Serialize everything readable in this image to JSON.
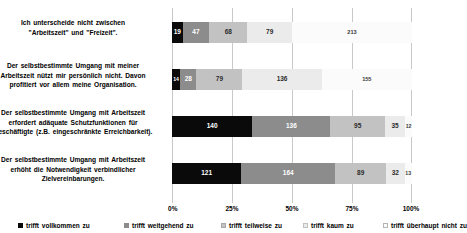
{
  "chart_data": {
    "type": "bar",
    "orientation": "horizontal",
    "stacked": true,
    "normalized": true,
    "title": "",
    "xlabel": "",
    "ylabel": "",
    "xlim": [
      0,
      100
    ],
    "xticks": [
      "0%",
      "25%",
      "50%",
      "75%",
      "100%"
    ],
    "xtick_values": [
      0,
      25,
      50,
      75,
      100
    ],
    "grid": true,
    "legend_position": "bottom",
    "categories": [
      "Ich unterscheide nicht zwischen \"Arbeitszeit\" und \"Freizeit\".",
      "Der selbstbestimmte Umgang mit meiner Arbeitszeit nützt mir persönlich nicht. Davon profitiert vor allem meine Organisation.",
      "Der selbstbestimmte Umgang mit Arbeitszeit erfordert adäquate Schutzfunktionen für Beschäftigte (z.B. eingeschränkte Erreichbarkeit).",
      "Der selbstbestimmte Umgang mit Arbeitszeit erhöht die Notwendigkeit verbindlicher Zielvereinbarungen."
    ],
    "series": [
      {
        "name": "trifft vollkommen zu",
        "color": "#0a0a0a",
        "values": [
          19,
          14,
          140,
          121
        ]
      },
      {
        "name": "trifft weitgehend zu",
        "color": "#8c8c8c",
        "values": [
          47,
          28,
          136,
          164
        ]
      },
      {
        "name": "trifft teilweise zu",
        "color": "#c2c2c2",
        "values": [
          68,
          79,
          95,
          89
        ]
      },
      {
        "name": "trifft kaum zu",
        "color": "#ebebeb",
        "values": [
          79,
          136,
          35,
          32
        ]
      },
      {
        "name": "trifft überhaupt nicht zu",
        "color": "#fcfcfc",
        "values": [
          213,
          155,
          12,
          13
        ]
      }
    ],
    "totals": [
      426,
      412,
      418,
      419
    ]
  },
  "rows": [
    {
      "label_lines": [
        "Ich unterscheide  nicht  zwischen",
        "\"Arbeitszeit\"  und  \"Freizeit\"."
      ],
      "values": [
        19,
        47,
        68,
        79,
        213
      ]
    },
    {
      "label_lines": [
        "Der selbstbestimmte  Umgang  mit meiner",
        "Arbeitszeit nützt mir  persönlich  nicht.  Davon",
        "profitiert vor allem meine Organisation."
      ],
      "values": [
        14,
        28,
        79,
        136,
        155
      ]
    },
    {
      "label_lines": [
        "Der selbstbestimmte  Umgang   mit Arbeitszeit",
        "erfordert adäquate  Schutzfunktionen  für",
        "Beschäftigte  (z.B. eingeschränkte  Erreichbarkeit)."
      ],
      "values": [
        140,
        136,
        95,
        35,
        12
      ]
    },
    {
      "label_lines": [
        "Der selbstbestimmte  Umgang   mit Arbeitszeit",
        "erhöht die Notwendigkeit  verbindlicher",
        "Zielvereinbarungen."
      ],
      "values": [
        121,
        164,
        89,
        32,
        13
      ]
    }
  ],
  "xaxis": {
    "ticks": [
      "0%",
      "25%",
      "50%",
      "75%",
      "100%"
    ]
  },
  "legend": {
    "items": [
      {
        "label": "trifft  vollkommen zu"
      },
      {
        "label": "trifft  weitgehend zu"
      },
      {
        "label": "trifft  teilweise zu"
      },
      {
        "label": "trifft  kaum  zu"
      },
      {
        "label": "trifft  überhaupt nicht zu"
      }
    ]
  }
}
